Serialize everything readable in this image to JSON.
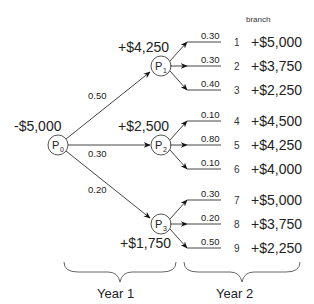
{
  "diagram": {
    "type": "probability-tree",
    "header": "branch",
    "root": {
      "node": {
        "base": "P",
        "sub": "0"
      },
      "value": "-$5,000"
    },
    "year1": [
      {
        "node": {
          "base": "P",
          "sub": "1"
        },
        "prob": "0.50",
        "value": "+$4,250"
      },
      {
        "node": {
          "base": "P",
          "sub": "2"
        },
        "prob": "0.30",
        "value": "+$2,500"
      },
      {
        "node": {
          "base": "P",
          "sub": "3"
        },
        "prob": "0.20",
        "value": "+$1,750"
      }
    ],
    "year2": [
      {
        "branch": "1",
        "prob": "0.30",
        "value": "+$5,000"
      },
      {
        "branch": "2",
        "prob": "0.30",
        "value": "+$3,750"
      },
      {
        "branch": "3",
        "prob": "0.40",
        "value": "+$2,250"
      },
      {
        "branch": "4",
        "prob": "0.10",
        "value": "+$4,500"
      },
      {
        "branch": "5",
        "prob": "0.80",
        "value": "+$4,250"
      },
      {
        "branch": "6",
        "prob": "0.10",
        "value": "+$4,000"
      },
      {
        "branch": "7",
        "prob": "0.30",
        "value": "+$5,000"
      },
      {
        "branch": "8",
        "prob": "0.20",
        "value": "+$3,750"
      },
      {
        "branch": "9",
        "prob": "0.50",
        "value": "+$2,250"
      }
    ],
    "periods": [
      "Year 1",
      "Year 2"
    ]
  }
}
